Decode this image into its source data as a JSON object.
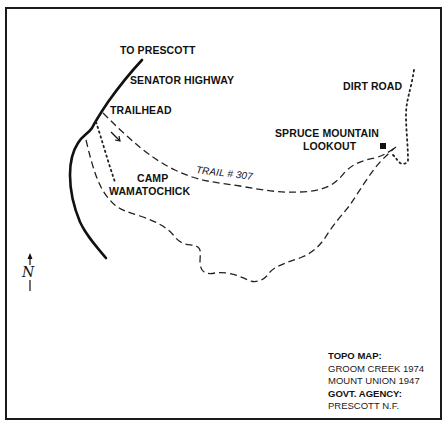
{
  "map": {
    "labels": {
      "to_prescott": "TO PRESCOTT",
      "senator_highway": "SENATOR HIGHWAY",
      "trailhead": "TRAILHEAD",
      "dirt_road": "DIRT ROAD",
      "lookout_line1": "SPRUCE MOUNTAIN",
      "lookout_line2": "LOOKOUT",
      "trail": "TRAIL  # 307",
      "camp_line1": "CAMP",
      "camp_line2": "WAMATOCHICK"
    },
    "north_symbol": "N"
  },
  "legend": {
    "topo_heading": "TOPO MAP:",
    "topo_items": [
      "GROOM CREEK 1974",
      "MOUNT UNION 1947"
    ],
    "agency_heading": "GOVT. AGENCY:",
    "agency_items": [
      "PRESCOTT N.F."
    ]
  }
}
